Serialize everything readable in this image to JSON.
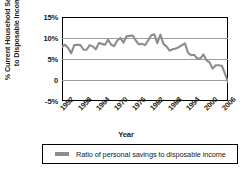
{
  "chart_data": {
    "type": "line",
    "title": "",
    "xlabel": "Year",
    "ylabel_line1": "% Current Household Savings",
    "ylabel_line2": "to Disposable Income",
    "ylim": [
      -5,
      15
    ],
    "xlim": [
      1952,
      2006
    ],
    "grid": true,
    "legend_position": "bottom",
    "y_ticks": [
      "15%",
      "10%",
      "5%",
      "0",
      "-5%"
    ],
    "y_tick_values": [
      15,
      10,
      5,
      0,
      -5
    ],
    "x_ticks": [
      "1952",
      "1958",
      "1964",
      "1970",
      "1976",
      "1982",
      "1988",
      "1994",
      "2000",
      "2006"
    ],
    "x_tick_values": [
      1952,
      1958,
      1964,
      1970,
      1976,
      1982,
      1988,
      1994,
      2000,
      2006
    ],
    "series": [
      {
        "name": "Ratio of personal savings to disposable income",
        "color": "#8c8c8c",
        "x": [
          1952,
          1953,
          1954,
          1955,
          1956,
          1957,
          1958,
          1959,
          1960,
          1961,
          1962,
          1963,
          1964,
          1965,
          1966,
          1967,
          1968,
          1969,
          1970,
          1971,
          1972,
          1973,
          1974,
          1975,
          1976,
          1977,
          1978,
          1979,
          1980,
          1981,
          1982,
          1983,
          1984,
          1985,
          1986,
          1987,
          1988,
          1989,
          1990,
          1991,
          1992,
          1993,
          1994,
          1995,
          1996,
          1997,
          1998,
          1999,
          2000,
          2001,
          2002,
          2003,
          2004,
          2005,
          2006
        ],
        "values": [
          7.9,
          8.4,
          7.6,
          6.4,
          8.3,
          8.4,
          8.3,
          7.2,
          7.2,
          8.3,
          8.0,
          7.3,
          8.8,
          8.6,
          8.4,
          9.6,
          8.4,
          8.1,
          9.4,
          10.0,
          8.9,
          10.4,
          10.5,
          10.6,
          9.4,
          8.5,
          8.6,
          8.3,
          9.4,
          10.6,
          10.9,
          8.8,
          10.8,
          8.6,
          8.0,
          7.0,
          7.3,
          7.5,
          7.8,
          8.3,
          8.7,
          6.5,
          5.9,
          6.0,
          5.1,
          5.1,
          6.1,
          4.7,
          4.2,
          2.7,
          3.5,
          3.5,
          3.4,
          1.5,
          -0.5
        ]
      }
    ]
  },
  "legend": {
    "items": [
      {
        "label": "Ratio of personal savings to disposable income",
        "color": "#8c8c8c"
      }
    ]
  }
}
